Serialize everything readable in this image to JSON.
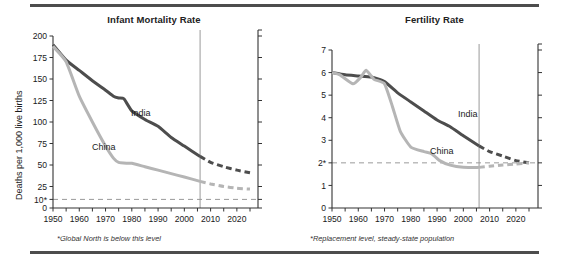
{
  "figure": {
    "panels": [
      {
        "id": "infant-mortality",
        "title": "Infant Mortality Rate",
        "ylabel": "Deaths per 1,000 live births",
        "footnote": "*Global North is below this level",
        "series_labels": {
          "india": "India",
          "china": "China"
        },
        "ytick_labels": [
          "0",
          "10*",
          "25",
          "50",
          "75",
          "100",
          "125",
          "150",
          "175",
          "200"
        ],
        "xtick_labels": [
          "1950",
          "1960",
          "1970",
          "1980",
          "1990",
          "2000",
          "2010",
          "2020"
        ]
      },
      {
        "id": "fertility",
        "title": "Fertility Rate",
        "ylabel": "Children per woman",
        "footnote": "*Replacement level, steady-state population",
        "series_labels": {
          "india": "India",
          "china": "China"
        },
        "ytick_labels": [
          "0",
          "1",
          "2*",
          "3",
          "4",
          "5",
          "6",
          "7"
        ],
        "xtick_labels": [
          "1950",
          "1960",
          "1970",
          "1980",
          "1990",
          "2000",
          "2010",
          "2020"
        ]
      }
    ]
  },
  "colors": {
    "india": "#4d4d4d",
    "china": "#b5b5b5",
    "axis": "#333333",
    "reference_line": "#9a9a9a",
    "now_line": "#9a9a9a",
    "rule": "#4d4d4d",
    "text": "#1a1a1a"
  },
  "chart_data": [
    {
      "type": "line",
      "title": "Infant Mortality Rate",
      "xlabel": "",
      "ylabel": "Deaths per 1,000 live births",
      "xlim": [
        1950,
        2025
      ],
      "ylim": [
        0,
        200
      ],
      "yticks": [
        0,
        10,
        25,
        50,
        75,
        100,
        125,
        150,
        175,
        200
      ],
      "ytick_labels": [
        "0",
        "10*",
        "25",
        "50",
        "75",
        "100",
        "125",
        "150",
        "175",
        "200"
      ],
      "xticks": [
        1950,
        1955,
        1960,
        1965,
        1970,
        1975,
        1980,
        1985,
        1990,
        1995,
        2000,
        2005,
        2010,
        2015,
        2020,
        2025
      ],
      "xtick_labels": [
        "1950",
        "",
        "1960",
        "",
        "1970",
        "",
        "1980",
        "",
        "1990",
        "",
        "2000",
        "",
        "2010",
        "",
        "2020",
        ""
      ],
      "grid": false,
      "legend": "inline-annotation",
      "reference_line": {
        "y": 10,
        "style": "dashed",
        "note": "*Global North is below this level"
      },
      "projection_start_year": 2006,
      "now_line_year": 2006,
      "series": [
        {
          "name": "India",
          "color": "#4d4d4d",
          "x": [
            1950,
            1955,
            1960,
            1965,
            1970,
            1973,
            1975,
            1977,
            1980,
            1985,
            1990,
            1995,
            2000,
            2006,
            2010,
            2015,
            2020,
            2025
          ],
          "values": [
            190,
            172,
            160,
            148,
            137,
            130,
            128,
            127,
            113,
            103,
            95,
            82,
            72,
            60,
            53,
            48,
            44,
            41
          ],
          "solid_until": 2006,
          "dashed_from": 2006
        },
        {
          "name": "China",
          "color": "#b5b5b5",
          "x": [
            1950,
            1955,
            1960,
            1965,
            1970,
            1973,
            1975,
            1978,
            1980,
            1985,
            1990,
            1995,
            2000,
            2006,
            2010,
            2015,
            2020,
            2025
          ],
          "values": [
            188,
            170,
            130,
            100,
            72,
            58,
            53,
            52,
            52,
            48,
            44,
            40,
            36,
            31,
            28,
            25,
            23,
            22
          ],
          "solid_until": 2006,
          "dashed_from": 2006
        }
      ]
    },
    {
      "type": "line",
      "title": "Fertility Rate",
      "xlabel": "",
      "ylabel": "Children per woman",
      "xlim": [
        1950,
        2025
      ],
      "ylim": [
        0,
        7
      ],
      "yticks": [
        0,
        1,
        2,
        3,
        4,
        5,
        6,
        7
      ],
      "ytick_labels": [
        "0",
        "1",
        "2*",
        "3",
        "4",
        "5",
        "6",
        "7"
      ],
      "xticks": [
        1950,
        1955,
        1960,
        1965,
        1970,
        1975,
        1980,
        1985,
        1990,
        1995,
        2000,
        2005,
        2010,
        2015,
        2020,
        2025
      ],
      "xtick_labels": [
        "1950",
        "",
        "1960",
        "",
        "1970",
        "",
        "1980",
        "",
        "1990",
        "",
        "2000",
        "",
        "2010",
        "",
        "2020",
        ""
      ],
      "grid": false,
      "legend": "inline-annotation",
      "reference_line": {
        "y": 2,
        "style": "dashed",
        "note": "*Replacement level, steady-state population"
      },
      "projection_start_year": 2006,
      "now_line_year": 2006,
      "series": [
        {
          "name": "India",
          "color": "#4d4d4d",
          "x": [
            1950,
            1955,
            1960,
            1965,
            1970,
            1975,
            1980,
            1985,
            1990,
            1995,
            2000,
            2006,
            2010,
            2015,
            2020,
            2025
          ],
          "values": [
            6.0,
            5.9,
            5.85,
            5.8,
            5.6,
            5.1,
            4.7,
            4.3,
            3.9,
            3.6,
            3.2,
            2.75,
            2.5,
            2.3,
            2.1,
            2.0
          ],
          "solid_until": 2006,
          "dashed_from": 2006
        },
        {
          "name": "China",
          "color": "#b5b5b5",
          "x": [
            1950,
            1953,
            1958,
            1961,
            1963,
            1966,
            1970,
            1973,
            1976,
            1980,
            1985,
            1988,
            1991,
            1995,
            2000,
            2006,
            2010,
            2015,
            2020,
            2025
          ],
          "values": [
            6.0,
            5.9,
            5.5,
            5.8,
            6.1,
            5.7,
            5.5,
            4.5,
            3.4,
            2.7,
            2.5,
            2.4,
            2.1,
            1.9,
            1.8,
            1.8,
            1.85,
            1.9,
            1.95,
            2.0
          ],
          "solid_until": 2006,
          "dashed_from": 2006
        }
      ]
    }
  ]
}
